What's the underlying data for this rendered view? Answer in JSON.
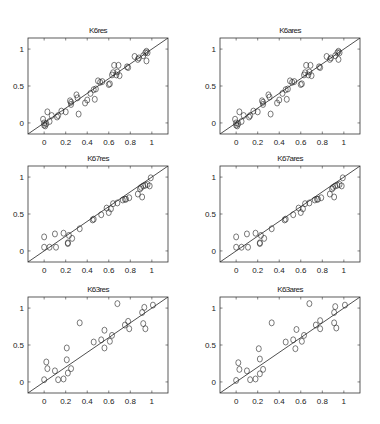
{
  "figure": {
    "width": 380,
    "height": 424,
    "background": "#ffffff"
  },
  "chart_data": [
    {
      "type": "scatter",
      "title": "K6res",
      "xlabel": "",
      "ylabel": "",
      "xlim": [
        -0.15,
        1.15
      ],
      "ylim": [
        -0.15,
        1.15
      ],
      "xticks": [
        "0",
        "0.2",
        "0.4",
        "0.6",
        "0.8",
        "1"
      ],
      "yticks": [
        "0",
        "0.5",
        "1"
      ],
      "reference_line": "y = x",
      "grid": false,
      "marker": "open circle",
      "points": [
        [
          -0.01,
          0.05
        ],
        [
          0.0,
          0.0
        ],
        [
          0.01,
          -0.04
        ],
        [
          0.0,
          -0.03
        ],
        [
          0.02,
          -0.01
        ],
        [
          0.03,
          0.15
        ],
        [
          0.05,
          0.02
        ],
        [
          0.07,
          0.1
        ],
        [
          0.12,
          0.08
        ],
        [
          0.13,
          0.1
        ],
        [
          0.16,
          0.16
        ],
        [
          0.2,
          0.15
        ],
        [
          0.24,
          0.3
        ],
        [
          0.25,
          0.25
        ],
        [
          0.25,
          0.28
        ],
        [
          0.3,
          0.38
        ],
        [
          0.31,
          0.34
        ],
        [
          0.32,
          0.12
        ],
        [
          0.38,
          0.27
        ],
        [
          0.4,
          0.31
        ],
        [
          0.43,
          0.4
        ],
        [
          0.46,
          0.45
        ],
        [
          0.47,
          0.32
        ],
        [
          0.48,
          0.46
        ],
        [
          0.5,
          0.57
        ],
        [
          0.52,
          0.55
        ],
        [
          0.54,
          0.56
        ],
        [
          0.6,
          0.52
        ],
        [
          0.61,
          0.53
        ],
        [
          0.63,
          0.65
        ],
        [
          0.64,
          0.68
        ],
        [
          0.65,
          0.78
        ],
        [
          0.67,
          0.65
        ],
        [
          0.68,
          0.69
        ],
        [
          0.69,
          0.78
        ],
        [
          0.7,
          0.64
        ],
        [
          0.77,
          0.76
        ],
        [
          0.78,
          0.75
        ],
        [
          0.84,
          0.9
        ],
        [
          0.87,
          0.86
        ],
        [
          0.88,
          0.88
        ],
        [
          0.92,
          0.91
        ],
        [
          0.94,
          0.95
        ],
        [
          0.95,
          0.97
        ],
        [
          0.95,
          0.84
        ],
        [
          0.96,
          0.95
        ]
      ]
    },
    {
      "type": "scatter",
      "title": "K6ares",
      "xlabel": "",
      "ylabel": "",
      "xlim": [
        -0.15,
        1.15
      ],
      "ylim": [
        -0.15,
        1.15
      ],
      "xticks": [
        "0",
        "0.2",
        "0.4",
        "0.6",
        "0.8",
        "1"
      ],
      "yticks": [
        "0",
        "0.5",
        "1"
      ],
      "reference_line": "y = x",
      "grid": false,
      "marker": "open circle",
      "points": [
        [
          -0.01,
          0.05
        ],
        [
          0.0,
          0.0
        ],
        [
          0.01,
          -0.04
        ],
        [
          0.0,
          -0.03
        ],
        [
          0.02,
          -0.01
        ],
        [
          0.03,
          0.15
        ],
        [
          0.05,
          0.02
        ],
        [
          0.07,
          0.1
        ],
        [
          0.12,
          0.08
        ],
        [
          0.13,
          0.1
        ],
        [
          0.16,
          0.16
        ],
        [
          0.2,
          0.15
        ],
        [
          0.24,
          0.3
        ],
        [
          0.25,
          0.25
        ],
        [
          0.25,
          0.28
        ],
        [
          0.3,
          0.38
        ],
        [
          0.31,
          0.35
        ],
        [
          0.32,
          0.12
        ],
        [
          0.38,
          0.27
        ],
        [
          0.4,
          0.31
        ],
        [
          0.43,
          0.4
        ],
        [
          0.46,
          0.45
        ],
        [
          0.47,
          0.32
        ],
        [
          0.48,
          0.46
        ],
        [
          0.5,
          0.57
        ],
        [
          0.52,
          0.55
        ],
        [
          0.54,
          0.56
        ],
        [
          0.6,
          0.52
        ],
        [
          0.61,
          0.53
        ],
        [
          0.63,
          0.65
        ],
        [
          0.64,
          0.68
        ],
        [
          0.65,
          0.78
        ],
        [
          0.67,
          0.65
        ],
        [
          0.68,
          0.69
        ],
        [
          0.69,
          0.78
        ],
        [
          0.7,
          0.64
        ],
        [
          0.77,
          0.76
        ],
        [
          0.78,
          0.75
        ],
        [
          0.84,
          0.9
        ],
        [
          0.87,
          0.86
        ],
        [
          0.88,
          0.88
        ],
        [
          0.92,
          0.91
        ],
        [
          0.94,
          0.95
        ],
        [
          0.95,
          0.97
        ],
        [
          0.95,
          0.86
        ],
        [
          0.96,
          0.95
        ]
      ]
    },
    {
      "type": "scatter",
      "title": "K67res",
      "xlabel": "",
      "ylabel": "",
      "xlim": [
        -0.15,
        1.15
      ],
      "ylim": [
        -0.15,
        1.15
      ],
      "xticks": [
        "0",
        "0.2",
        "0.4",
        "0.6",
        "0.8",
        "1"
      ],
      "yticks": [
        "0",
        "0.5",
        "1"
      ],
      "reference_line": "y = x",
      "grid": false,
      "marker": "open circle",
      "points": [
        [
          0.0,
          0.19
        ],
        [
          0.0,
          0.05
        ],
        [
          0.05,
          0.05
        ],
        [
          0.1,
          0.23
        ],
        [
          0.11,
          0.05
        ],
        [
          0.18,
          0.24
        ],
        [
          0.22,
          0.1
        ],
        [
          0.22,
          0.11
        ],
        [
          0.23,
          0.21
        ],
        [
          0.26,
          0.17
        ],
        [
          0.33,
          0.3
        ],
        [
          0.45,
          0.42
        ],
        [
          0.46,
          0.43
        ],
        [
          0.53,
          0.49
        ],
        [
          0.58,
          0.58
        ],
        [
          0.6,
          0.52
        ],
        [
          0.62,
          0.57
        ],
        [
          0.64,
          0.64
        ],
        [
          0.68,
          0.65
        ],
        [
          0.73,
          0.69
        ],
        [
          0.75,
          0.7
        ],
        [
          0.76,
          0.7
        ],
        [
          0.79,
          0.72
        ],
        [
          0.87,
          0.77
        ],
        [
          0.89,
          0.84
        ],
        [
          0.9,
          0.86
        ],
        [
          0.91,
          0.73
        ],
        [
          0.92,
          0.88
        ],
        [
          0.94,
          0.89
        ],
        [
          0.96,
          0.9
        ],
        [
          0.98,
          0.88
        ],
        [
          0.99,
          0.99
        ]
      ]
    },
    {
      "type": "scatter",
      "title": "K67ares",
      "xlabel": "",
      "ylabel": "",
      "xlim": [
        -0.15,
        1.15
      ],
      "ylim": [
        -0.15,
        1.15
      ],
      "xticks": [
        "0",
        "0.2",
        "0.4",
        "0.6",
        "0.8",
        "1"
      ],
      "yticks": [
        "0",
        "0.5",
        "1"
      ],
      "reference_line": "y = x",
      "grid": false,
      "marker": "open circle",
      "points": [
        [
          0.0,
          0.19
        ],
        [
          0.0,
          0.05
        ],
        [
          0.05,
          0.05
        ],
        [
          0.1,
          0.23
        ],
        [
          0.11,
          0.05
        ],
        [
          0.18,
          0.24
        ],
        [
          0.22,
          0.1
        ],
        [
          0.22,
          0.11
        ],
        [
          0.23,
          0.21
        ],
        [
          0.26,
          0.17
        ],
        [
          0.33,
          0.3
        ],
        [
          0.45,
          0.42
        ],
        [
          0.46,
          0.43
        ],
        [
          0.53,
          0.49
        ],
        [
          0.58,
          0.58
        ],
        [
          0.6,
          0.52
        ],
        [
          0.62,
          0.57
        ],
        [
          0.64,
          0.64
        ],
        [
          0.68,
          0.65
        ],
        [
          0.73,
          0.69
        ],
        [
          0.75,
          0.7
        ],
        [
          0.76,
          0.7
        ],
        [
          0.79,
          0.72
        ],
        [
          0.87,
          0.77
        ],
        [
          0.89,
          0.84
        ],
        [
          0.9,
          0.86
        ],
        [
          0.91,
          0.73
        ],
        [
          0.92,
          0.88
        ],
        [
          0.94,
          0.89
        ],
        [
          0.96,
          0.9
        ],
        [
          0.98,
          0.88
        ],
        [
          0.99,
          0.99
        ]
      ]
    },
    {
      "type": "scatter",
      "title": "K63res",
      "xlabel": "",
      "ylabel": "",
      "xlim": [
        -0.15,
        1.15
      ],
      "ylim": [
        -0.15,
        1.15
      ],
      "xticks": [
        "0",
        "0.2",
        "0.4",
        "0.6",
        "0.8",
        "1"
      ],
      "yticks": [
        "0",
        "0.5",
        "1"
      ],
      "reference_line": "y = x",
      "grid": false,
      "marker": "open circle",
      "points": [
        [
          0.0,
          0.03
        ],
        [
          0.02,
          0.27
        ],
        [
          0.03,
          0.18
        ],
        [
          0.1,
          0.15
        ],
        [
          0.13,
          0.03
        ],
        [
          0.18,
          0.04
        ],
        [
          0.21,
          0.46
        ],
        [
          0.21,
          0.3
        ],
        [
          0.22,
          0.12
        ],
        [
          0.25,
          0.18
        ],
        [
          0.33,
          0.8
        ],
        [
          0.46,
          0.54
        ],
        [
          0.53,
          0.57
        ],
        [
          0.56,
          0.46
        ],
        [
          0.56,
          0.7
        ],
        [
          0.61,
          0.55
        ],
        [
          0.63,
          0.63
        ],
        [
          0.68,
          1.06
        ],
        [
          0.75,
          0.77
        ],
        [
          0.78,
          0.82
        ],
        [
          0.79,
          0.72
        ],
        [
          0.91,
          0.94
        ],
        [
          0.92,
          0.79
        ],
        [
          0.93,
          1.01
        ],
        [
          0.94,
          0.72
        ],
        [
          1.01,
          1.04
        ]
      ]
    },
    {
      "type": "scatter",
      "title": "K63ares",
      "xlabel": "",
      "ylabel": "",
      "xlim": [
        -0.15,
        1.15
      ],
      "ylim": [
        -0.15,
        1.15
      ],
      "xticks": [
        "0",
        "0.2",
        "0.4",
        "0.6",
        "0.8",
        "1"
      ],
      "yticks": [
        "0",
        "0.5",
        "1"
      ],
      "reference_line": "y = x",
      "grid": false,
      "marker": "open circle",
      "points": [
        [
          0.0,
          0.02
        ],
        [
          0.02,
          0.26
        ],
        [
          0.03,
          0.17
        ],
        [
          0.1,
          0.15
        ],
        [
          0.13,
          0.03
        ],
        [
          0.18,
          0.04
        ],
        [
          0.21,
          0.45
        ],
        [
          0.22,
          0.31
        ],
        [
          0.22,
          0.11
        ],
        [
          0.25,
          0.17
        ],
        [
          0.33,
          0.8
        ],
        [
          0.46,
          0.54
        ],
        [
          0.53,
          0.57
        ],
        [
          0.55,
          0.45
        ],
        [
          0.56,
          0.71
        ],
        [
          0.61,
          0.55
        ],
        [
          0.63,
          0.63
        ],
        [
          0.68,
          1.06
        ],
        [
          0.74,
          0.77
        ],
        [
          0.78,
          0.83
        ],
        [
          0.78,
          0.72
        ],
        [
          0.91,
          0.94
        ],
        [
          0.91,
          0.8
        ],
        [
          0.92,
          1.02
        ],
        [
          0.93,
          0.73
        ],
        [
          1.01,
          1.04
        ]
      ]
    }
  ]
}
